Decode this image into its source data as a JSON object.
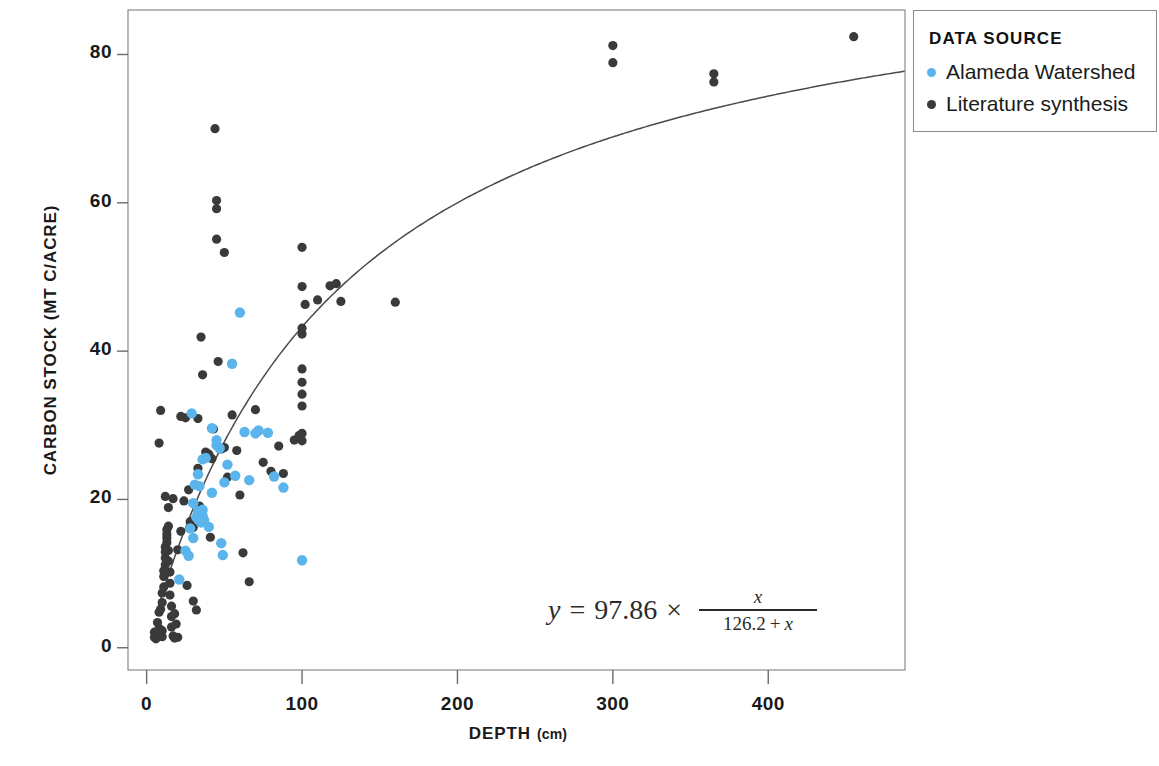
{
  "chart_data": {
    "type": "scatter",
    "title": "",
    "xlabel": "DEPTH",
    "xlabel_unit": "(cm)",
    "ylabel": "CARBON STOCK (MT C/ACRE)",
    "xlim": [
      -12,
      488
    ],
    "ylim": [
      -3,
      86
    ],
    "xticks": [
      0,
      100,
      200,
      300,
      400
    ],
    "yticks": [
      0,
      20,
      40,
      60,
      80
    ],
    "grid": false,
    "legend": {
      "position": "top-right-outside",
      "title": "DATA SOURCE",
      "entries": [
        {
          "label": "Alameda Watershed",
          "color": "#5BB4EC"
        },
        {
          "label": "Literature synthesis",
          "color": "#3a3a3a"
        }
      ]
    },
    "annotation": {
      "text": "y = 97.86 × x / (126.2 + x)",
      "lhs": "y",
      "equals": "=",
      "coefficient": "97.86",
      "times": "×",
      "numerator": "x",
      "denominator_const": "126.2",
      "denominator_plus": "+",
      "denominator_var": "x"
    },
    "fit_curve": {
      "name": "Michaelis-Menten fit",
      "form": "y = Vmax * x / (K + x)",
      "Vmax": 97.86,
      "K": 126.2,
      "color": "#4a4a4a",
      "x_start": 7,
      "x_end": 560
    },
    "series": [
      {
        "name": "Alameda Watershed",
        "color": "#5BB4EC",
        "marker": "circle",
        "points": [
          [
            21,
            9.2
          ],
          [
            25,
            13.1
          ],
          [
            27,
            12.4
          ],
          [
            29,
            31.6
          ],
          [
            30,
            19.5
          ],
          [
            31,
            22.0
          ],
          [
            32,
            17.6
          ],
          [
            33,
            17.9
          ],
          [
            33,
            18.4
          ],
          [
            34,
            17.3
          ],
          [
            34,
            18.1
          ],
          [
            35,
            17.5
          ],
          [
            35,
            18.2
          ],
          [
            35,
            16.9
          ],
          [
            36,
            17.8
          ],
          [
            36,
            18.6
          ],
          [
            37,
            17.2
          ],
          [
            33,
            23.4
          ],
          [
            34,
            21.8
          ],
          [
            38,
            25.6
          ],
          [
            40,
            16.3
          ],
          [
            42,
            20.9
          ],
          [
            45,
            27.3
          ],
          [
            45,
            28.0
          ],
          [
            47,
            26.9
          ],
          [
            48,
            14.1
          ],
          [
            49,
            12.5
          ],
          [
            52,
            24.7
          ],
          [
            55,
            38.3
          ],
          [
            57,
            23.2
          ],
          [
            60,
            45.2
          ],
          [
            63,
            29.1
          ],
          [
            66,
            22.6
          ],
          [
            70,
            28.9
          ],
          [
            72,
            29.3
          ],
          [
            78,
            29.0
          ],
          [
            82,
            23.1
          ],
          [
            88,
            21.6
          ],
          [
            100,
            11.8
          ],
          [
            30,
            14.8
          ],
          [
            28,
            16.1
          ],
          [
            36,
            25.4
          ],
          [
            42,
            29.6
          ],
          [
            50,
            22.3
          ]
        ]
      },
      {
        "name": "Literature synthesis",
        "color": "#3a3a3a",
        "marker": "circle",
        "points": [
          [
            5,
            1.4
          ],
          [
            5,
            2.1
          ],
          [
            6,
            1.2
          ],
          [
            7,
            1.8
          ],
          [
            7,
            3.4
          ],
          [
            8,
            2.6
          ],
          [
            8,
            4.8
          ],
          [
            9,
            5.2
          ],
          [
            9,
            1.9
          ],
          [
            10,
            2.3
          ],
          [
            10,
            6.1
          ],
          [
            10,
            7.4
          ],
          [
            11,
            8.2
          ],
          [
            11,
            9.6
          ],
          [
            11,
            10.4
          ],
          [
            12,
            11.2
          ],
          [
            12,
            12.1
          ],
          [
            12,
            12.9
          ],
          [
            12,
            13.6
          ],
          [
            13,
            14.2
          ],
          [
            13,
            14.8
          ],
          [
            13,
            15.3
          ],
          [
            13,
            15.9
          ],
          [
            14,
            16.4
          ],
          [
            14,
            13.1
          ],
          [
            14,
            11.7
          ],
          [
            15,
            10.2
          ],
          [
            15,
            8.7
          ],
          [
            15,
            7.1
          ],
          [
            16,
            5.6
          ],
          [
            16,
            4.2
          ],
          [
            16,
            2.8
          ],
          [
            17,
            1.6
          ],
          [
            10,
            1.5
          ],
          [
            18,
            1.3
          ],
          [
            20,
            1.4
          ],
          [
            8,
            27.6
          ],
          [
            9,
            32.0
          ],
          [
            12,
            20.4
          ],
          [
            14,
            18.9
          ],
          [
            17,
            20.1
          ],
          [
            20,
            13.2
          ],
          [
            22,
            15.7
          ],
          [
            22,
            31.2
          ],
          [
            25,
            31.0
          ],
          [
            26,
            8.4
          ],
          [
            28,
            17.0
          ],
          [
            30,
            6.3
          ],
          [
            32,
            5.1
          ],
          [
            33,
            30.9
          ],
          [
            33,
            24.2
          ],
          [
            34,
            19.1
          ],
          [
            35,
            41.9
          ],
          [
            36,
            36.8
          ],
          [
            38,
            26.4
          ],
          [
            40,
            26.1
          ],
          [
            41,
            14.9
          ],
          [
            42,
            25.5
          ],
          [
            44,
            70.0
          ],
          [
            45,
            60.3
          ],
          [
            45,
            59.2
          ],
          [
            45,
            55.1
          ],
          [
            46,
            38.6
          ],
          [
            48,
            26.8
          ],
          [
            50,
            27.0
          ],
          [
            50,
            53.3
          ],
          [
            52,
            23.0
          ],
          [
            55,
            31.4
          ],
          [
            58,
            26.6
          ],
          [
            60,
            20.6
          ],
          [
            62,
            12.8
          ],
          [
            66,
            8.9
          ],
          [
            70,
            32.1
          ],
          [
            75,
            25.0
          ],
          [
            80,
            23.8
          ],
          [
            85,
            27.2
          ],
          [
            88,
            23.5
          ],
          [
            95,
            28.0
          ],
          [
            98,
            28.6
          ],
          [
            100,
            54.0
          ],
          [
            100,
            48.7
          ],
          [
            100,
            43.1
          ],
          [
            100,
            42.3
          ],
          [
            100,
            37.6
          ],
          [
            100,
            35.8
          ],
          [
            100,
            34.2
          ],
          [
            100,
            32.6
          ],
          [
            100,
            28.9
          ],
          [
            100,
            27.9
          ],
          [
            102,
            46.3
          ],
          [
            110,
            46.9
          ],
          [
            118,
            48.8
          ],
          [
            122,
            49.1
          ],
          [
            125,
            46.7
          ],
          [
            160,
            46.6
          ],
          [
            300,
            81.2
          ],
          [
            300,
            78.9
          ],
          [
            365,
            77.4
          ],
          [
            365,
            76.3
          ],
          [
            455,
            82.4
          ],
          [
            18,
            4.6
          ],
          [
            19,
            3.2
          ],
          [
            24,
            19.8
          ],
          [
            27,
            21.3
          ],
          [
            30,
            16.2
          ],
          [
            43,
            29.5
          ]
        ]
      }
    ]
  },
  "axis": {
    "y_tick_labels": [
      "80",
      "60",
      "40",
      "20",
      "0"
    ],
    "x_tick_labels": [
      "0",
      "100",
      "200",
      "300",
      "400"
    ]
  }
}
